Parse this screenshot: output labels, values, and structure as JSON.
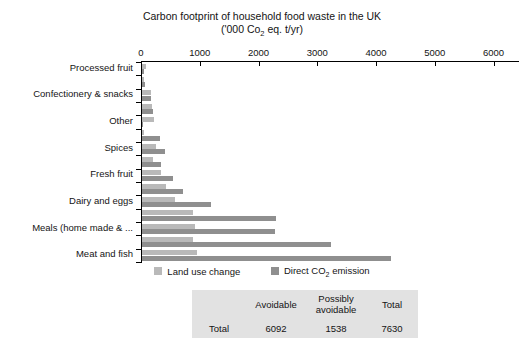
{
  "chart_data": {
    "type": "bar",
    "orientation": "horizontal",
    "stacked": false,
    "grouped": true,
    "title": "Carbon footprint of household food waste in the UK",
    "subtitle_prefix": "('000 Co",
    "subtitle_sub": "2",
    "subtitle_suffix": " eq. t/yr)",
    "xlabel": "",
    "ylabel": "",
    "xlim": [
      0,
      6400
    ],
    "xticks": [
      0,
      1000,
      2000,
      3000,
      4000,
      5000,
      6000
    ],
    "xticklabels": [
      "0",
      "1000",
      "2000",
      "3000",
      "4000",
      "5000",
      "6000"
    ],
    "grid": false,
    "legend_position": "bottom-center",
    "categories": [
      "Processed fruit",
      "Processed vegetables",
      "Confectionery & snacks",
      "Condiments, sauces, herbs & spices",
      "Other",
      "Cakes & desserts",
      "Spices",
      "Fish & shellfish",
      "Fresh fruit",
      "Fresh vegetables & salads",
      "Dairy and eggs",
      "Staple foods",
      "Meals (home made & ...",
      "Drink",
      "Meat and fish"
    ],
    "category_labels_shown": [
      "Processed fruit",
      "Confectionery & snacks",
      "Other",
      "Spices",
      "Fresh fruit",
      "Dairy and eggs",
      "Meals (home made & ...",
      "Meat and fish"
    ],
    "series": [
      {
        "name": "Land use change",
        "color": "#b9b9b9",
        "values": [
          60,
          40,
          150,
          170,
          200,
          30,
          230,
          180,
          330,
          400,
          560,
          870,
          900,
          860,
          940
        ]
      },
      {
        "name": "Direct CO2 emission",
        "color": "#8f8f8f",
        "values": [
          35,
          55,
          160,
          190,
          25,
          300,
          390,
          330,
          530,
          700,
          1170,
          2280,
          2260,
          3220,
          4230
        ]
      }
    ]
  },
  "legend": {
    "items": [
      {
        "label": "Land use change",
        "color_key": "luc"
      },
      {
        "label_prefix": "Direct CO",
        "label_sub": "2",
        "label_suffix": " emission",
        "color_key": "dce"
      }
    ]
  },
  "summary_table": {
    "columns": [
      "",
      "Avoidable",
      "Possibly avoidable",
      "Total"
    ],
    "col_avoidable": "Avoidable",
    "col_possibly_line1": "Possibly",
    "col_possibly_line2": "avoidable",
    "col_total": "Total",
    "rows": [
      {
        "label": "Total",
        "avoidable": "6092",
        "possibly_avoidable": "1538",
        "total": "7630"
      }
    ],
    "background": "#e2e2e2"
  }
}
